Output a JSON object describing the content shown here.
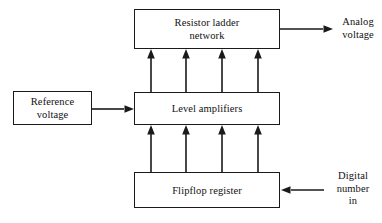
{
  "diagram": {
    "background_color": "#ffffff",
    "line_color": "#1a1a1a",
    "text_color": "#111111",
    "boxes": [
      {
        "id": "resistor-ladder-network",
        "label": "Resistor ladder\nnetwork",
        "x": 134,
        "y": 9,
        "width": 146,
        "height": 40
      },
      {
        "id": "level-amplifiers",
        "label": "Level amplifiers",
        "x": 134,
        "y": 92,
        "width": 146,
        "height": 33
      },
      {
        "id": "flipflop-register",
        "label": "Flipflop register",
        "x": 134,
        "y": 172,
        "width": 146,
        "height": 36
      },
      {
        "id": "reference-voltage",
        "label": "Reference\nvoltage",
        "x": 13,
        "y": 91,
        "width": 79,
        "height": 34
      }
    ],
    "free_labels": [
      {
        "id": "analog-voltage-label",
        "text": "Analog\nvoltage",
        "x": 334,
        "y": 16,
        "width": 48
      },
      {
        "id": "digital-number-in-label",
        "text": "Digital\nnumber\nin",
        "x": 327,
        "y": 170,
        "width": 52
      }
    ],
    "connectors": [
      {
        "id": "register-to-amplifiers-1",
        "from": "flipflop-register",
        "to": "level-amplifiers",
        "direction": "up",
        "x": 151
      },
      {
        "id": "register-to-amplifiers-2",
        "from": "flipflop-register",
        "to": "level-amplifiers",
        "direction": "up",
        "x": 186
      },
      {
        "id": "register-to-amplifiers-3",
        "from": "flipflop-register",
        "to": "level-amplifiers",
        "direction": "up",
        "x": 222
      },
      {
        "id": "register-to-amplifiers-4",
        "from": "flipflop-register",
        "to": "level-amplifiers",
        "direction": "up",
        "x": 258
      },
      {
        "id": "amplifiers-to-ladder-1",
        "from": "level-amplifiers",
        "to": "resistor-ladder-network",
        "direction": "up",
        "x": 151
      },
      {
        "id": "amplifiers-to-ladder-2",
        "from": "level-amplifiers",
        "to": "resistor-ladder-network",
        "direction": "up",
        "x": 186
      },
      {
        "id": "amplifiers-to-ladder-3",
        "from": "level-amplifiers",
        "to": "resistor-ladder-network",
        "direction": "up",
        "x": 222
      },
      {
        "id": "amplifiers-to-ladder-4",
        "from": "level-amplifiers",
        "to": "resistor-ladder-network",
        "direction": "up",
        "x": 258
      },
      {
        "id": "reference-to-amplifiers",
        "from": "reference-voltage",
        "to": "level-amplifiers",
        "direction": "right",
        "y": 109
      },
      {
        "id": "ladder-to-analog-voltage",
        "from": "resistor-ladder-network",
        "to": "analog-voltage-label",
        "direction": "right",
        "y": 29
      },
      {
        "id": "digital-number-to-register",
        "from": "digital-number-in-label",
        "to": "flipflop-register",
        "direction": "left",
        "y": 190
      }
    ]
  }
}
